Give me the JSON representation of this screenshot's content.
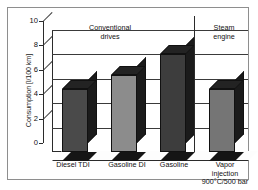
{
  "chart_data": {
    "type": "bar",
    "title": "",
    "subtitle": "",
    "xlabel": "",
    "ylabel": "Consumption [l/100 km]",
    "categories": [
      "Diesel TDI",
      "Gasoline DI",
      "Gasoline",
      "Vapor injection 900°C/500 bar"
    ],
    "values": [
      5.2,
      6.3,
      8.0,
      5.2
    ],
    "series": [
      {
        "name": "Consumption",
        "values": [
          5.2,
          6.3,
          8.0,
          5.2
        ]
      }
    ],
    "ylim": [
      0,
      10
    ],
    "yticks": [
      0,
      2,
      4,
      6,
      8,
      10
    ],
    "ytick_labels": [
      "0",
      "2",
      "4",
      "6",
      "8",
      "10"
    ],
    "grid": true,
    "grid_axis": "y",
    "legend": false,
    "legend_position": "none",
    "style": "3d-bar",
    "bar_colors": [
      "#4a4a4a",
      "#8c8c8c",
      "#3d3d3d",
      "#757575"
    ],
    "annotations": [
      {
        "id": "group-conventional",
        "text": "Conventional\ndrives",
        "covers": [
          0,
          1,
          2
        ]
      },
      {
        "id": "group-steam",
        "text": "Steam\nengine",
        "covers": [
          3
        ]
      }
    ],
    "group_divider_after_index": 2
  },
  "axis": {
    "y_title": "Consumption [l/100 km]",
    "ticks": [
      {
        "value": 10,
        "label": "10"
      },
      {
        "value": 8,
        "label": "8"
      },
      {
        "value": 6,
        "label": "6"
      },
      {
        "value": 4,
        "label": "4"
      },
      {
        "value": 2,
        "label": "2"
      },
      {
        "value": 0,
        "label": "0"
      }
    ]
  },
  "groups": {
    "conventional_line1": "Conventional",
    "conventional_line2": "drives",
    "steam_line1": "Steam",
    "steam_line2": "engine"
  },
  "categories": {
    "cat0_line1": "Diesel TDI",
    "cat1_line1": "Gasoline DI",
    "cat2_line1": "Gasoline",
    "cat3_line1": "Vapor",
    "cat3_line2": "injection",
    "cat3_line3": "900°C/500 bar"
  },
  "colors": {
    "frame": "#8e8e8e",
    "axis": "#2b2b2b",
    "grid": "#3a3a3a",
    "text": "#111111",
    "bar_light": "#8c8c8c",
    "bar_mid": "#757575",
    "bar_dark": "#4a4a4a",
    "bar_darkest": "#3d3d3d"
  }
}
